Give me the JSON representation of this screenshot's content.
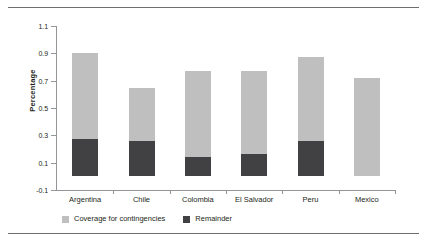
{
  "chart_data": {
    "type": "bar",
    "subtype": "stacked-vertical",
    "title": "",
    "xlabel": "",
    "ylabel": "Percentage",
    "ylim": [
      -0.1,
      1.1
    ],
    "yticks": [
      "1.1",
      "0.9",
      "0.7",
      "0.5",
      "0.3",
      "0.1",
      "-0.1"
    ],
    "ytick_values": [
      1.1,
      0.9,
      0.7,
      0.5,
      0.3,
      0.1,
      -0.1
    ],
    "grid": false,
    "legend_position": "bottom-left",
    "categories": [
      "Argentina",
      "Chile",
      "Colombia",
      "El Salvador",
      "Peru",
      "Mexico"
    ],
    "series": [
      {
        "name": "Remainder",
        "color": "#414042",
        "values": [
          0.27,
          0.26,
          0.14,
          0.16,
          0.26,
          0.0
        ]
      },
      {
        "name": "Coverage for contingencies",
        "color": "#bfbfbf",
        "values": [
          0.63,
          0.39,
          0.63,
          0.61,
          0.61,
          0.72
        ]
      }
    ],
    "totals": [
      0.9,
      0.65,
      0.77,
      0.77,
      0.87,
      0.72
    ],
    "stack_order": [
      "Remainder",
      "Coverage for contingencies"
    ]
  },
  "legend": {
    "items": [
      {
        "label": "Coverage for contingencies",
        "color": "#bfbfbf"
      },
      {
        "label": "Remainder",
        "color": "#414042"
      }
    ]
  }
}
